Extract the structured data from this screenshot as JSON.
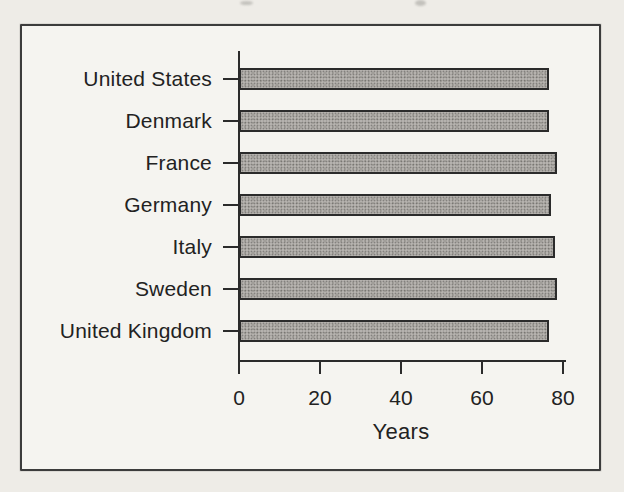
{
  "page": {
    "paper_color": "#eeece7",
    "frame_background_color": "#f5f4f0",
    "frame_border_color": "#3c3c3c",
    "text_color": "#222222"
  },
  "chart_data": {
    "type": "bar",
    "orientation": "horizontal",
    "title": "",
    "categories": [
      "United States",
      "Denmark",
      "France",
      "Germany",
      "Italy",
      "Sweden",
      "United Kingdom"
    ],
    "values": [
      76.5,
      76.5,
      78.5,
      77,
      78,
      78.5,
      76.5
    ],
    "unit": "Years",
    "xlabel": "Years",
    "xticks": [
      "0",
      "20",
      "40",
      "60",
      "80"
    ],
    "xtick_values": [
      0,
      20,
      40,
      60,
      80
    ],
    "xlim": [
      0,
      80
    ],
    "grid": false,
    "legend": false,
    "axis_color": "#2b2b2b",
    "bar_fill_color": "#b5b2ae",
    "bar_border_color": "#2b2b2b"
  }
}
